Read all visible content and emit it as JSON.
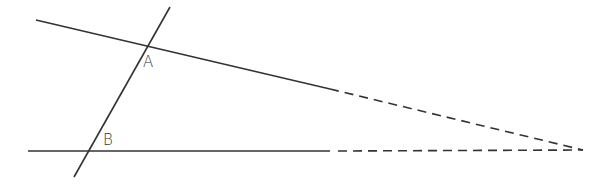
{
  "diagram": {
    "type": "geometry-transversal",
    "stroke_color": "#333333",
    "points": [
      {
        "label": "A",
        "x": 147,
        "y": 45
      },
      {
        "label": "B",
        "x": 89,
        "y": 151
      }
    ],
    "lines": {
      "top_line": {
        "solid": [
          [
            36,
            20
          ],
          [
            330,
            89
          ]
        ],
        "dashed": [
          [
            330,
            89
          ],
          [
            583,
            150
          ]
        ]
      },
      "bottom_line": {
        "solid": [
          [
            28,
            151
          ],
          [
            330,
            151
          ]
        ],
        "dashed": [
          [
            330,
            151
          ],
          [
            583,
            150
          ]
        ]
      },
      "transversal": [
        [
          170,
          7
        ],
        [
          74,
          177
        ]
      ]
    }
  }
}
